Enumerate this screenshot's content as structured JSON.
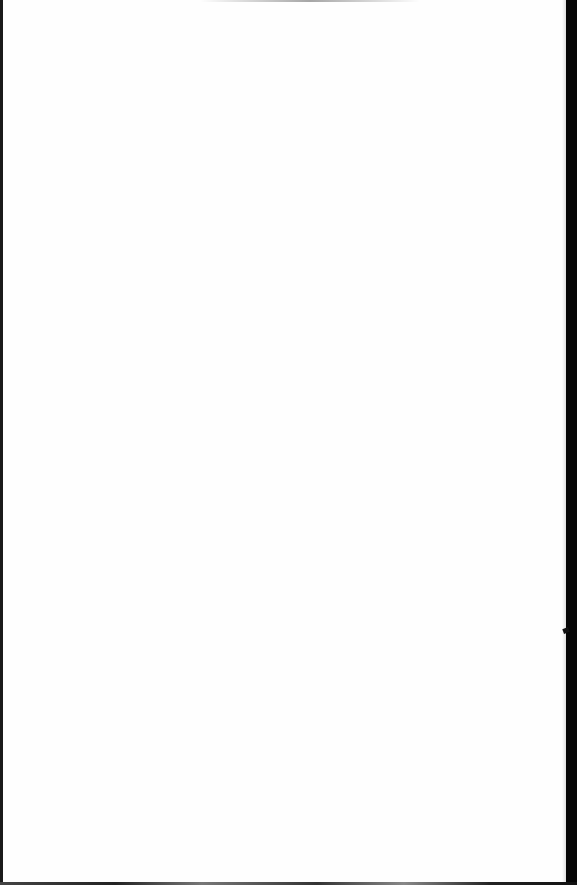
{
  "document": {
    "type": "scanned-page",
    "content": "",
    "text_blocks": []
  },
  "colors": {
    "paper": "#fefefe",
    "scan_edge": "#050505"
  }
}
